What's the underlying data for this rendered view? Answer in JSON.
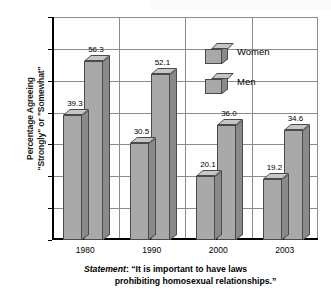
{
  "chart_data": {
    "type": "bar",
    "title": "",
    "subtitle": "",
    "xlabel": "",
    "ylabel": "Percentage Agreeing \"Strongly\" or \"Somewhat\"",
    "ylabel_lines": [
      "Percentage Agreeing",
      "\"Strongly\" or \"Somewhat\""
    ],
    "categories": [
      "1980",
      "1990",
      "2000",
      "2003"
    ],
    "series": [
      {
        "name": "Women",
        "values": [
          39.3,
          30.5,
          20.1,
          19.2
        ]
      },
      {
        "name": "Men",
        "values": [
          56.3,
          52.1,
          36.0,
          34.6
        ]
      }
    ],
    "value_labels": {
      "Women": [
        "39.3",
        "30.5",
        "20.1",
        "19.2"
      ],
      "Men": [
        "56.3",
        "52.1",
        "36.0",
        "34.6"
      ]
    },
    "ylim": [
      0,
      70
    ],
    "ytick_values": [
      0,
      10,
      20,
      30,
      40,
      50,
      60,
      70
    ],
    "ytick_labels": [
      "0",
      "10",
      "20",
      "30",
      "40",
      "50",
      "60",
      "70"
    ],
    "grid": true,
    "grid_orientation": "both",
    "legend_position": "top-right",
    "style": "3d-bars",
    "bar_color": "#a9a9a9",
    "bar_side_color": "#8a8a8a",
    "bar_top_color": "#c6c6c6",
    "bar_outline_color": "#4a4a4a",
    "grid_color": "#8c8c8c",
    "axis_color": "#000000",
    "annotations": [
      "Statement: \"It is important to have laws prohibiting homosexual relationships.\""
    ]
  },
  "legend": {
    "items": [
      {
        "label": "Women",
        "icon": "cube-3d-icon"
      },
      {
        "label": "Men",
        "icon": "cube-3d-icon"
      }
    ]
  },
  "caption": {
    "label": "Statement",
    "separator": ":",
    "line1": "“It is important to have laws",
    "line2": "prohibiting homosexual relationships.”"
  }
}
